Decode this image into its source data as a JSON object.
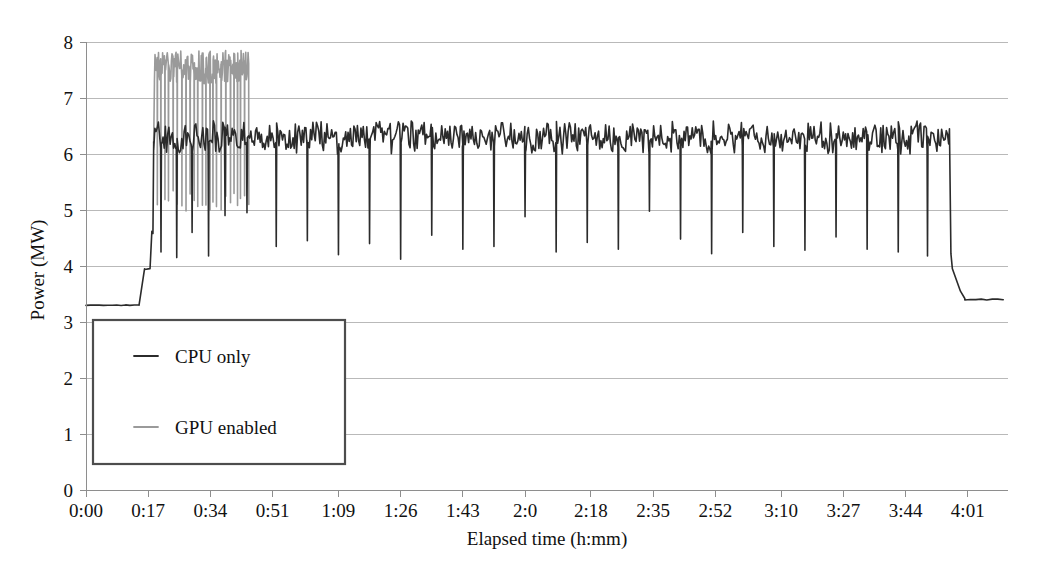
{
  "chart_data": {
    "type": "line",
    "title": "",
    "xlabel": "Elapsed time (h:mm)",
    "ylabel": "Power (MW)",
    "ylim": [
      0,
      8
    ],
    "yticks": [
      0,
      1,
      2,
      3,
      4,
      5,
      6,
      7,
      8
    ],
    "ytick_labels": [
      "0",
      "1",
      "2",
      "3",
      "4",
      "5",
      "6",
      "7",
      "8"
    ],
    "grid": true,
    "xtick_labels": [
      "0:00",
      "0:17",
      "0:34",
      "0:51",
      "1:09",
      "1:26",
      "1:43",
      "2:0",
      "2:18",
      "2:35",
      "2:52",
      "3:10",
      "3:27",
      "3:44",
      "4:01"
    ],
    "xtick_minutes": [
      0,
      17,
      34,
      51,
      69,
      86,
      103,
      120,
      138,
      155,
      172,
      190,
      207,
      224,
      241
    ],
    "xlim_minutes": [
      0,
      252
    ],
    "legend": {
      "position": "lower-left-inside",
      "entries": [
        {
          "label": "CPU only",
          "color": "#2b2b2b",
          "linewidth": 1.6
        },
        {
          "label": "GPU enabled",
          "color": "#9a9a9a",
          "linewidth": 1.6
        }
      ]
    },
    "series": [
      {
        "name": "CPU only",
        "color": "#2b2b2b",
        "description": "Node power during CPU-only run: idle baseline 3.30 MW, step to 3.95 MW, sustained noisy load band 6.0-6.6 MW with periodic deep dips to 4.1-4.9 MW, returning to 3.40 MW at end.",
        "baseline_mw": 3.3,
        "step_mw": 3.95,
        "load_band_mw": [
          6.02,
          6.58
        ],
        "load_mean_mw": 6.3,
        "dip_floor_mw": [
          4.1,
          4.95
        ],
        "tail_mw": 3.4,
        "events_minutes": {
          "idle_until": 14.5,
          "step_start": 14.5,
          "step_end": 16.0,
          "ramp_start": 17.5,
          "load_start": 18.5,
          "load_end": 236.0,
          "drop_end": 239.0,
          "tail_end": 252.0
        },
        "dip_minutes": [
          20.5,
          24.8,
          29.0,
          33.5,
          38.0,
          44.0,
          52.0,
          60.5,
          69.0,
          77.5,
          86.0,
          94.5,
          103.0,
          111.5,
          120.0,
          128.5,
          137.0,
          145.5,
          154.0,
          162.5,
          171.0,
          179.5,
          188.0,
          196.5,
          205.0,
          213.5,
          222.0,
          230.0
        ],
        "dip_depth_mw": [
          4.25,
          4.15,
          4.6,
          4.18,
          4.9,
          4.95,
          4.35,
          4.45,
          4.2,
          4.4,
          4.12,
          4.55,
          4.3,
          4.35,
          4.88,
          4.25,
          4.42,
          4.3,
          4.98,
          4.48,
          4.22,
          4.6,
          4.35,
          4.28,
          4.52,
          4.3,
          4.25,
          4.18
        ]
      },
      {
        "name": "GPU enabled",
        "color": "#9a9a9a",
        "description": "Overlaid GPU-enabled run: high noisy band 7.25-7.85 MW during the first active interval with very frequent deep vertical dips down to 4.9-5.3 MW.",
        "band_mw": [
          7.25,
          7.85
        ],
        "band_mean_mw": 7.55,
        "dip_floor_mw": [
          4.95,
          5.35
        ],
        "events_minutes": {
          "start": 18.5,
          "end": 44.5
        }
      }
    ]
  },
  "axis": {
    "y_title": "Power (MW)",
    "x_title": "Elapsed time (h:mm)"
  }
}
